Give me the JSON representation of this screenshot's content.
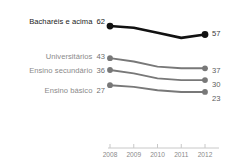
{
  "chart_data": {
    "type": "line",
    "title": "",
    "subtitle": "",
    "xlabel": "",
    "ylabel": "",
    "x": [
      2008,
      2009,
      2010,
      2011,
      2012
    ],
    "tick_labels": [
      "2008",
      "2009",
      "2010",
      "2011",
      "2012"
    ],
    "grid": false,
    "legend_position": "inline-left-and-right",
    "ylim": [
      20,
      65
    ],
    "series": [
      {
        "name": "Bacharéis e acima",
        "start_label": "62",
        "end_label": "57",
        "values": [
          62,
          61,
          58,
          55,
          57
        ],
        "color": "#111111",
        "emphasis": true
      },
      {
        "name": "Universitários",
        "start_label": "43",
        "end_label": "37",
        "values": [
          43,
          41,
          38,
          37,
          37
        ],
        "color": "#787878",
        "emphasis": false
      },
      {
        "name": "Ensino secundário",
        "start_label": "36",
        "end_label": "30",
        "values": [
          36,
          34,
          31,
          30,
          30
        ],
        "color": "#787878",
        "emphasis": false
      },
      {
        "name": "Ensino básico",
        "start_label": "27",
        "end_label": "23",
        "values": [
          27,
          26,
          24,
          23,
          23
        ],
        "color": "#787878",
        "emphasis": false
      }
    ],
    "axis": {
      "line_color": "#c8c8c8",
      "tick_color": "#c8c8c8"
    }
  },
  "colors": {
    "background": "#ffffff",
    "emphasis_series": "#111111",
    "muted_series": "#787878",
    "label_emphasis": "#1a1a1a",
    "label_muted": "#8a8a8a",
    "axis": "#c8c8c8"
  }
}
